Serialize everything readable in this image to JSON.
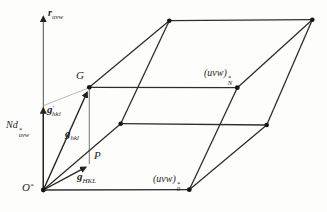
{
  "figure": {
    "type": "reciprocal-lattice-laue-zones-diagram",
    "background": "#fdfdfb",
    "edge_color": "#2d2d2d",
    "thin_line_color": "#999999",
    "text_color": "#1d1d1d",
    "labels": {
      "axis": {
        "base": "r",
        "sub": "uvw"
      },
      "g_prime_hkl": {
        "base": "g",
        "prime": "′",
        "sub": "hkl"
      },
      "Nd_star_uvw": {
        "base": "Nd",
        "sup": "*",
        "sub": "uvw"
      },
      "g_hkl": {
        "base": "g",
        "sub": "hkl"
      },
      "g_HKL": {
        "base": "g",
        "sub": "HKL"
      },
      "point_G": {
        "base": "G"
      },
      "point_P": {
        "base": "P"
      },
      "origin": {
        "base": "O",
        "sup": "*"
      },
      "plane_N": {
        "base": "(uvw)",
        "sup": "*",
        "sub": "N"
      },
      "plane_0": {
        "base": "(uvw)",
        "sup": "*",
        "sub": "0"
      }
    }
  }
}
